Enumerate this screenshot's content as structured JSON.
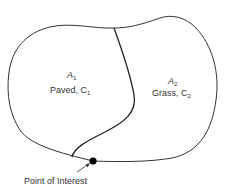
{
  "diagram": {
    "regions": [
      {
        "id": "A1",
        "symbol": "A",
        "symbol_sub": "1",
        "surface": "Paved",
        "coef": "C",
        "coef_sub": "1",
        "surface_label": "Paved, "
      },
      {
        "id": "A2",
        "symbol": "A",
        "symbol_sub": "2",
        "surface": "Grass",
        "coef": "C",
        "coef_sub": "2",
        "surface_label": "Grass, "
      }
    ],
    "point_label": "Point of Interest",
    "colors": {
      "stroke": "#333333",
      "dot": "#000000",
      "text": "#333333"
    }
  }
}
